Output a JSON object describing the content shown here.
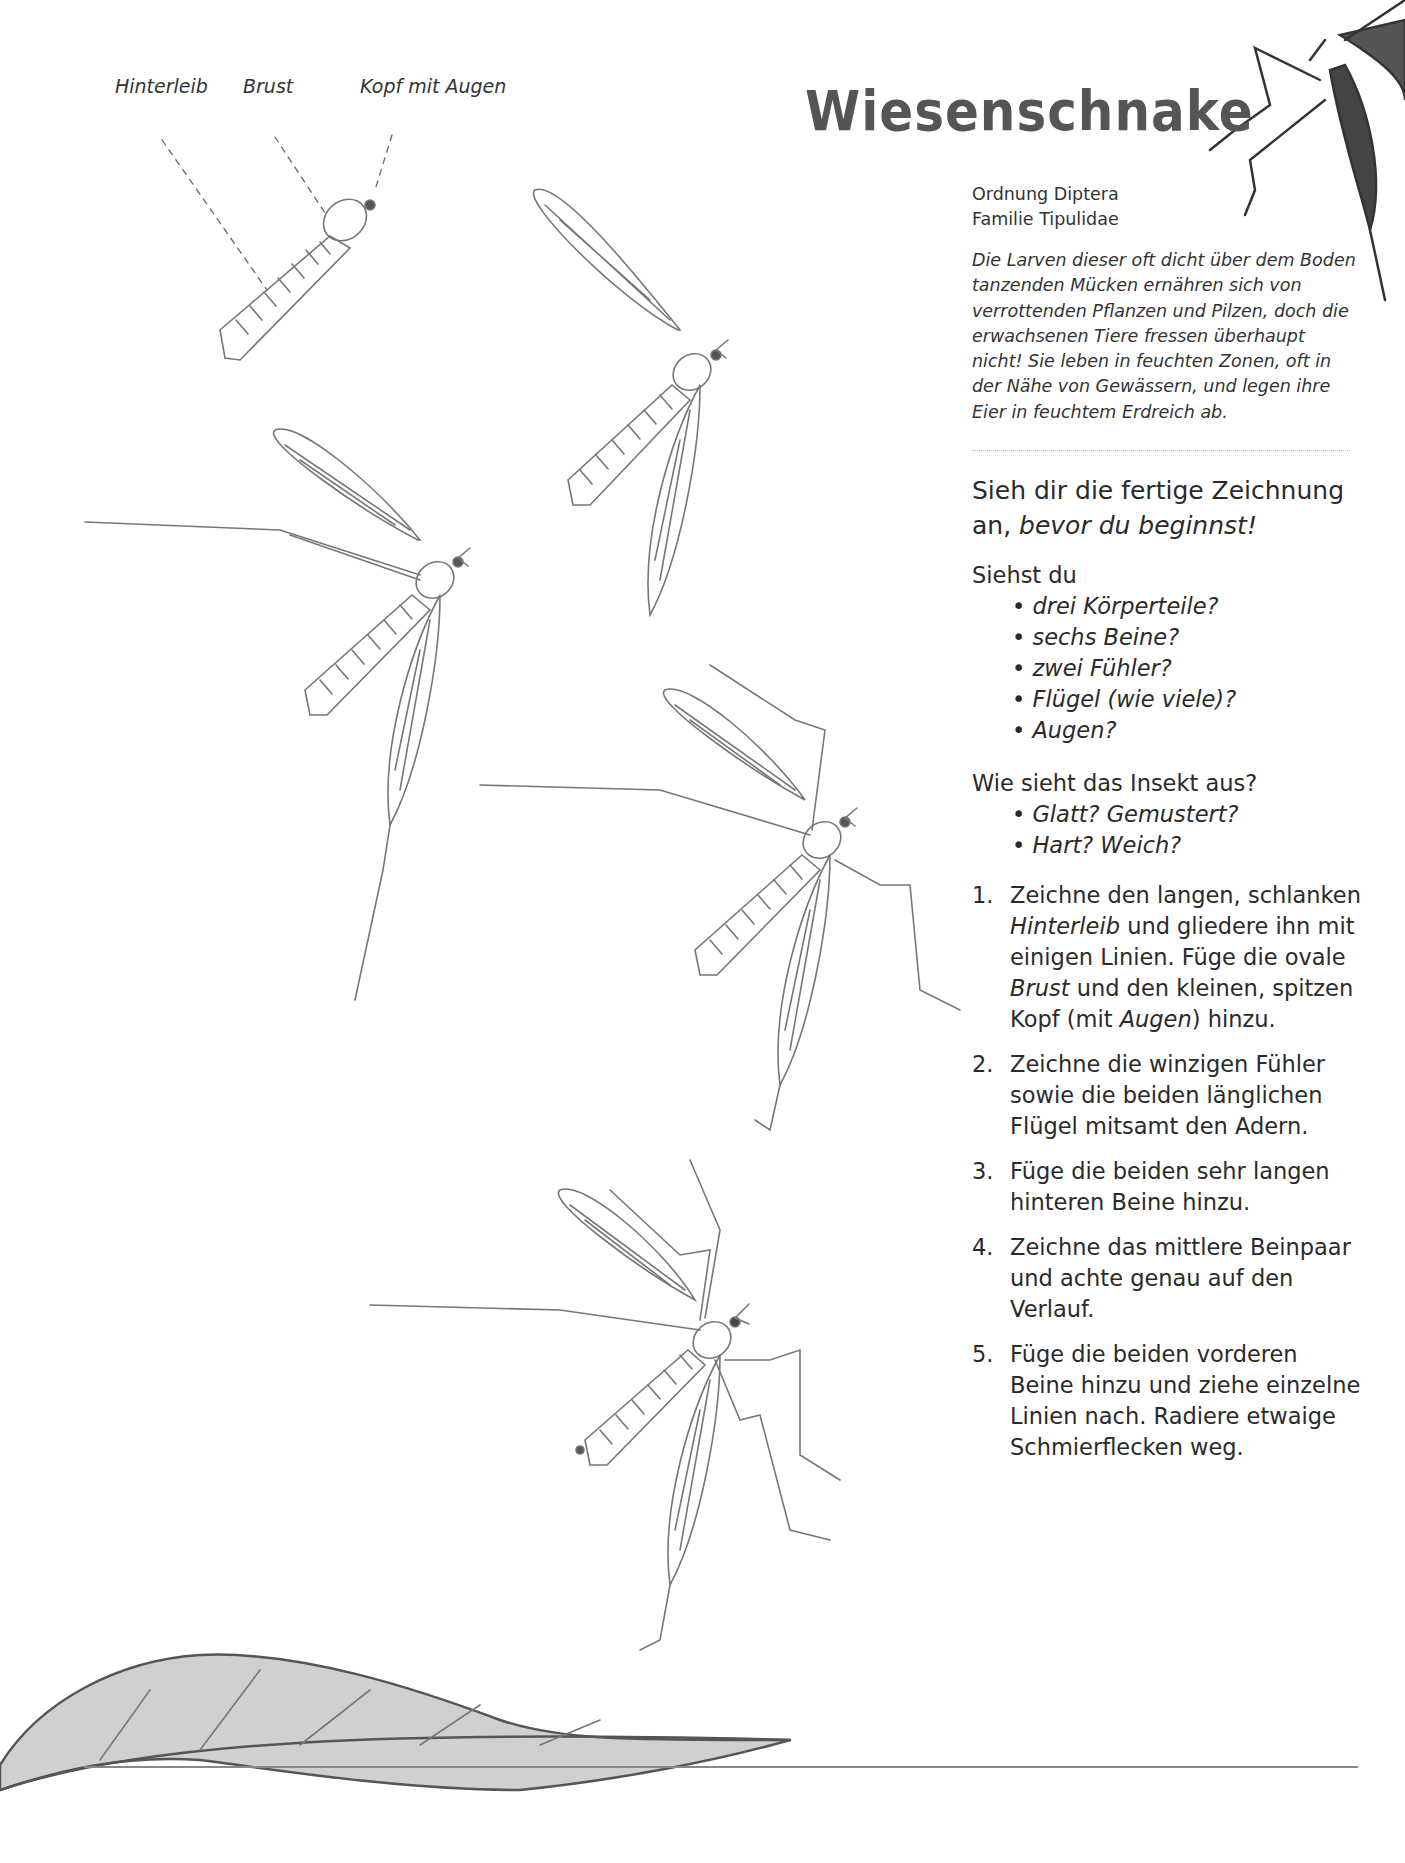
{
  "title": "Wiesenschnake",
  "anatomy_labels": {
    "abdomen": "Hinterleib",
    "thorax": "Brust",
    "head": "Kopf mit Augen"
  },
  "taxonomy": {
    "order": "Ordnung Diptera",
    "family": "Familie Tipulidae"
  },
  "description": "Die Larven dieser oft dicht über dem Boden tanzenden Mücken ernähren sich von verrottenden Pflanzen und Pilzen, doch die erwachsenen Tiere fressen überhaupt nicht! Sie leben in feuchten Zonen, oft in der Nähe von Gewässern, und legen ihre Eier in feuchtem Erdreich ab.",
  "intro": {
    "heading_plain": "Sieh dir die fertige Zeichnung an,",
    "heading_emphasis": "bevor du beginnst!"
  },
  "checklist_1": {
    "prompt": "Siehst du",
    "items": [
      "drei Körperteile?",
      "sechs Beine?",
      "zwei Fühler?",
      "Flügel (wie viele)?",
      "Augen?"
    ]
  },
  "checklist_2": {
    "prompt": "Wie sieht das Insekt aus?",
    "items": [
      "Glatt? Gemustert?",
      "Hart? Weich?"
    ]
  },
  "steps": [
    {
      "num": "1.",
      "parts": [
        "Zeichne den langen, schlanken ",
        "Hinterleib",
        " und gliedere ihn mit einigen Linien. Füge die ovale ",
        "Brust",
        " und den kleinen, spitzen Kopf (mit ",
        "Augen",
        ") hinzu."
      ]
    },
    {
      "num": "2.",
      "text": "Zeichne die winzigen Fühler sowie die beiden länglichen Flügel mitsamt den Adern."
    },
    {
      "num": "3.",
      "text": "Füge die beiden sehr langen hinteren Beine hinzu."
    },
    {
      "num": "4.",
      "text": "Zeichne das mittlere Beinpaar und achte genau auf den Verlauf."
    },
    {
      "num": "5.",
      "text": "Füge die beiden vorderen Beine hinzu und ziehe einzelne Linien nach. Radiere etwaige Schmierflecken weg."
    }
  ],
  "illustrations": [
    "step-1-body",
    "step-2-wings",
    "step-3-hind-legs",
    "step-4-middle-legs",
    "step-5-front-legs",
    "leaf",
    "corner-crane-fly"
  ]
}
